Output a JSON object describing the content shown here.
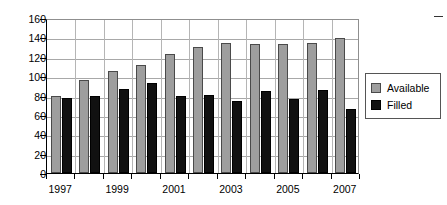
{
  "chart_data": {
    "type": "bar",
    "title": "",
    "subtitle": "",
    "xlabel": "",
    "ylabel": "",
    "categories": [
      "1997",
      "1998",
      "1999",
      "2000",
      "2001",
      "2002",
      "2003",
      "2004",
      "2005",
      "2006",
      "2007"
    ],
    "series": [
      {
        "name": "Available",
        "color": "#9e9e9e",
        "values": [
          80,
          96,
          105,
          111,
          123,
          130,
          134,
          133,
          133,
          134,
          139
        ]
      },
      {
        "name": "Filled",
        "color": "#111111",
        "values": [
          77,
          80,
          87,
          93,
          79,
          81,
          74,
          85,
          76,
          86,
          66
        ]
      }
    ],
    "ylim": [
      0,
      160
    ],
    "yticks": [
      0,
      20,
      40,
      60,
      80,
      100,
      120,
      140,
      160
    ],
    "ytick_labels": [
      "0",
      "20",
      "40",
      "60",
      "80",
      "100",
      "120",
      "140",
      "160"
    ],
    "xtick_labels_shown": [
      "1997",
      "1999",
      "2001",
      "2003",
      "2005",
      "2007"
    ],
    "grid": true,
    "grid_axis": "y",
    "legend_position": "right"
  },
  "legend": {
    "items": [
      {
        "label": "Available",
        "swatch": "available-swatch"
      },
      {
        "label": "Filled",
        "swatch": "filled-swatch"
      }
    ]
  },
  "corner": {
    "tick_icon": "dash-icon"
  }
}
